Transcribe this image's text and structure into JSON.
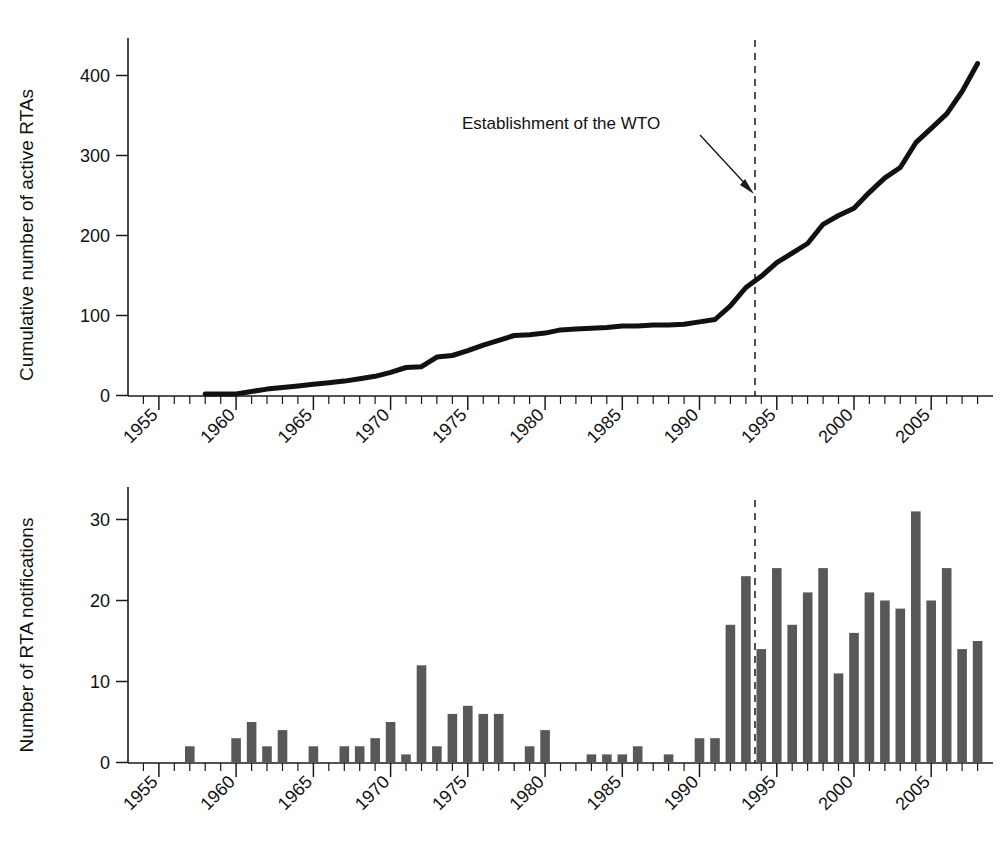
{
  "figure": {
    "background_color": "#ffffff",
    "line_color": "#111111",
    "bar_color": "#585858",
    "axis_color": "#1a1a1a"
  },
  "annotation": {
    "label": "Establishment of the WTO",
    "marker_year": 1995
  },
  "chart_data": [
    {
      "type": "line",
      "title": "",
      "xlabel": "",
      "ylabel": "Cumulative number of active RTAs",
      "xlim": [
        1953,
        2009
      ],
      "ylim": [
        0,
        440
      ],
      "yticks": [
        0,
        100,
        200,
        300,
        400
      ],
      "ytick_labels": [
        "0",
        "100",
        "200",
        "300",
        "400"
      ],
      "xticks": [
        1955,
        1960,
        1965,
        1970,
        1975,
        1980,
        1985,
        1990,
        1995,
        2000,
        2005
      ],
      "xtick_labels": [
        "1955",
        "1960",
        "1965",
        "1970",
        "1975",
        "1980",
        "1985",
        "1990",
        "1995",
        "2000",
        "2005"
      ],
      "minor_xtick_interval": 1,
      "grid": false,
      "legend": "none",
      "annotations": [
        {
          "text": "Establishment of the WTO",
          "x": 1995,
          "note": "dashed vertical line with arrow"
        }
      ],
      "x": [
        1958,
        1959,
        1960,
        1961,
        1962,
        1963,
        1964,
        1965,
        1966,
        1967,
        1968,
        1969,
        1970,
        1971,
        1972,
        1973,
        1974,
        1975,
        1976,
        1977,
        1978,
        1979,
        1980,
        1981,
        1982,
        1983,
        1984,
        1985,
        1986,
        1987,
        1988,
        1989,
        1990,
        1991,
        1992,
        1993,
        1994,
        1995,
        1996,
        1997,
        1998,
        1999,
        2000,
        2001,
        2002,
        2003,
        2004,
        2005,
        2006,
        2007,
        2008
      ],
      "values": [
        2,
        2,
        2,
        5,
        8,
        10,
        12,
        14,
        16,
        18,
        21,
        24,
        29,
        35,
        36,
        48,
        50,
        56,
        63,
        69,
        75,
        76,
        78,
        82,
        83,
        84,
        85,
        87,
        87,
        88,
        88,
        89,
        92,
        95,
        112,
        135,
        149,
        166,
        178,
        190,
        214,
        225,
        234,
        254,
        272,
        285,
        316,
        334,
        352,
        380,
        415
      ]
    },
    {
      "type": "bar",
      "title": "",
      "xlabel": "",
      "ylabel": "Number of RTA notifications",
      "xlim": [
        1953,
        2009
      ],
      "ylim": [
        0,
        35
      ],
      "yticks": [
        0,
        10,
        20,
        30
      ],
      "ytick_labels": [
        "0",
        "10",
        "20",
        "30"
      ],
      "xticks": [
        1955,
        1960,
        1965,
        1970,
        1975,
        1980,
        1985,
        1990,
        1995,
        2000,
        2005
      ],
      "xtick_labels": [
        "1955",
        "1960",
        "1965",
        "1970",
        "1975",
        "1980",
        "1985",
        "1990",
        "1995",
        "2000",
        "2005"
      ],
      "minor_xtick_interval": 1,
      "grid": false,
      "legend": "none",
      "annotations": [
        {
          "text": "",
          "x": 1995,
          "note": "dashed vertical line marking WTO establishment"
        }
      ],
      "categories": [
        1955,
        1956,
        1957,
        1958,
        1959,
        1960,
        1961,
        1962,
        1963,
        1964,
        1965,
        1966,
        1967,
        1968,
        1969,
        1970,
        1971,
        1972,
        1973,
        1974,
        1975,
        1976,
        1977,
        1978,
        1979,
        1980,
        1981,
        1982,
        1983,
        1984,
        1985,
        1986,
        1987,
        1988,
        1989,
        1990,
        1991,
        1992,
        1993,
        1994,
        1995,
        1996,
        1997,
        1998,
        1999,
        2000,
        2001,
        2002,
        2003,
        2004,
        2005,
        2006,
        2007,
        2008
      ],
      "values": [
        0,
        0,
        2,
        0,
        0,
        3,
        5,
        2,
        4,
        0,
        2,
        0,
        2,
        2,
        3,
        5,
        1,
        12,
        2,
        6,
        7,
        6,
        6,
        0,
        2,
        4,
        0,
        0,
        1,
        1,
        1,
        2,
        0,
        1,
        0,
        3,
        3,
        17,
        23,
        14,
        24,
        17,
        21,
        24,
        11,
        16,
        21,
        20,
        19,
        31,
        20,
        24,
        14,
        15
      ]
    }
  ]
}
